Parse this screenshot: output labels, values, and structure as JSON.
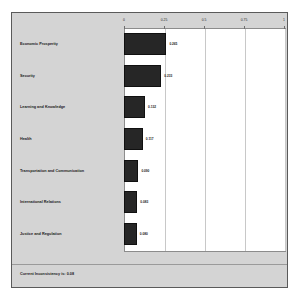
{
  "chart_data": {
    "type": "bar",
    "orientation": "horizontal",
    "title": "",
    "xlabel": "",
    "ylabel": "",
    "xlim": [
      0,
      1
    ],
    "grid": true,
    "legend": null,
    "xticks": [
      "0",
      "0.25",
      "0.5",
      "0.75",
      "1"
    ],
    "xtick_values": [
      0,
      0.25,
      0.5,
      0.75,
      1
    ],
    "categories": [
      "Economic Prosperity",
      "Security",
      "Learning and Knowledge",
      "Health",
      "Transportation and Communication",
      "International Relations",
      "Justice and Regulation"
    ],
    "values": [
      0.265,
      0.233,
      0.132,
      0.117,
      0.09,
      0.083,
      0.08
    ],
    "value_labels": [
      "0.265",
      "0.233",
      "0.132",
      "0.117",
      "0.090",
      "0.083",
      "0.080"
    ]
  },
  "footer": {
    "inconsistency_text": "Current Inconsistency is: 0.08"
  },
  "colors": {
    "bar": "#262626",
    "panel_background": "#d4d4d4",
    "plot_background": "#ffffff",
    "gridline": "#c8c8c8",
    "border": "#5a5a5a"
  }
}
